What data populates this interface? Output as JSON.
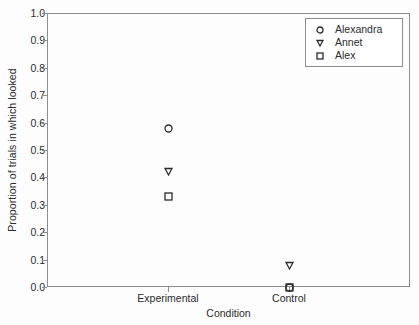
{
  "chart_data": {
    "type": "scatter",
    "title": "",
    "xlabel": "Condition",
    "ylabel": "Proportion of trials in which looked",
    "categories": [
      "Experimental",
      "Control"
    ],
    "ylim": [
      0.0,
      1.0
    ],
    "yticks": [
      "1.0",
      "0.9",
      "0.8",
      "0.7",
      "0.6",
      "0.5",
      "0.4",
      "0.3",
      "0.2",
      "0.1",
      "0.0"
    ],
    "ytick_values": [
      1.0,
      0.9,
      0.8,
      0.7,
      0.6,
      0.5,
      0.4,
      0.3,
      0.2,
      0.1,
      0.0
    ],
    "grid": false,
    "legend_position": "top-right",
    "series": [
      {
        "name": "Alexandra",
        "marker": "circle",
        "values": [
          0.58,
          0.0
        ]
      },
      {
        "name": "Annet",
        "marker": "triangle-down",
        "values": [
          0.42,
          0.08
        ]
      },
      {
        "name": "Alex",
        "marker": "square",
        "values": [
          0.33,
          0.0
        ]
      }
    ]
  },
  "legend": {
    "entries": [
      {
        "label": "Alexandra",
        "marker": "circle-marker-icon"
      },
      {
        "label": "Annet",
        "marker": "triangle-down-marker-icon"
      },
      {
        "label": "Alex",
        "marker": "square-marker-icon"
      }
    ]
  },
  "colors": {
    "axis": "#8d8d8d",
    "marker": "#2b2b2b",
    "text": "#2b2b2b",
    "background": "#fdfdfd"
  }
}
